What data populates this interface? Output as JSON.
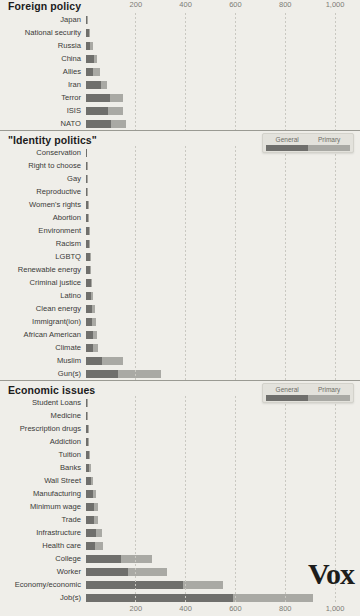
{
  "legend": {
    "general_label": "General",
    "primary_label": "Primary"
  },
  "logo": {
    "text": "Vox"
  },
  "axis": {
    "ticks": [
      "200",
      "400",
      "600",
      "800",
      "1,000"
    ]
  },
  "sections": [
    {
      "title": "Foreign policy"
    },
    {
      "title": "\"Identity politics\""
    },
    {
      "title": "Economic issues"
    }
  ],
  "chart_data": {
    "type": "bar",
    "orientation": "horizontal",
    "stacked": true,
    "title": "",
    "xlabel": "",
    "ylabel": "",
    "xlim": [
      0,
      1100
    ],
    "grid": true,
    "legend_position": "top-right",
    "series": [
      {
        "name": "General",
        "color": "#6f6f6c"
      },
      {
        "name": "Primary",
        "color": "#a9a9a4"
      }
    ],
    "axis_ticks": [
      200,
      400,
      600,
      800,
      1000
    ],
    "groups": [
      {
        "title": "Foreign policy",
        "categories": [
          "Japan",
          "National security",
          "Russia",
          "China",
          "Allies",
          "Iran",
          "Terror",
          "ISIS",
          "NATO"
        ],
        "general": [
          6,
          14,
          18,
          33,
          30,
          60,
          95,
          88,
          100
        ],
        "primary": [
          2,
          4,
          10,
          12,
          25,
          25,
          55,
          60,
          60
        ],
        "totals": [
          8,
          18,
          28,
          45,
          55,
          85,
          150,
          148,
          160
        ]
      },
      {
        "title": "\"Identity politics\"",
        "categories": [
          "Conservation",
          "Right to choose",
          "Gay",
          "Reproductive",
          "Women's rights",
          "Abortion",
          "Environment",
          "Racism",
          "LGBTQ",
          "Renewable energy",
          "Criminal justice",
          "Latino",
          "Clean energy",
          "Immigrant(ion)",
          "African American",
          "Climate",
          "Muslim",
          "Gun(s)"
        ],
        "general": [
          1,
          3,
          4,
          6,
          9,
          10,
          11,
          14,
          15,
          16,
          20,
          20,
          24,
          26,
          30,
          28,
          65,
          130
        ],
        "primary": [
          0,
          1,
          1,
          1,
          2,
          2,
          3,
          3,
          4,
          5,
          5,
          10,
          12,
          14,
          14,
          22,
          85,
          170
        ],
        "totals": [
          1,
          4,
          5,
          7,
          11,
          12,
          14,
          17,
          19,
          21,
          25,
          30,
          36,
          40,
          44,
          50,
          150,
          300
        ]
      },
      {
        "title": "Economic issues",
        "categories": [
          "Student Loans",
          "Medicine",
          "Prescription drugs",
          "Addiction",
          "Tuition",
          "Banks",
          "Wall Street",
          "Manufacturing",
          "Minimum wage",
          "Trade",
          "Infrastructure",
          "Health care",
          "College",
          "Worker",
          "Economy/economic",
          "Job(s)"
        ],
        "general": [
          3,
          4,
          8,
          10,
          13,
          14,
          20,
          30,
          32,
          34,
          40,
          38,
          140,
          170,
          390,
          590
        ],
        "primary": [
          1,
          1,
          2,
          3,
          4,
          6,
          8,
          10,
          18,
          16,
          25,
          32,
          125,
          155,
          160,
          320
        ],
        "totals": [
          4,
          5,
          10,
          13,
          17,
          20,
          28,
          40,
          50,
          50,
          65,
          70,
          265,
          325,
          550,
          910
        ]
      }
    ]
  }
}
